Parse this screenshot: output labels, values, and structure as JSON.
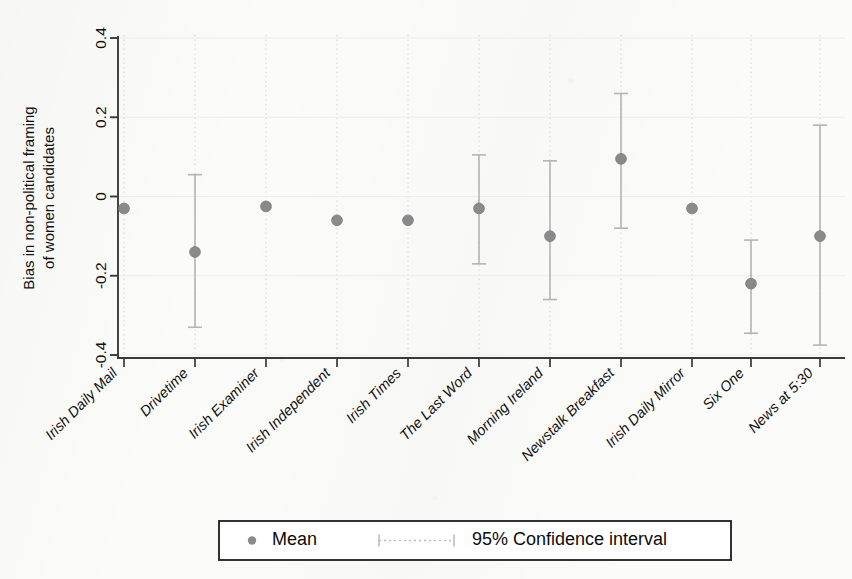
{
  "chart_data": {
    "type": "scatter",
    "title": "",
    "subtitle": "",
    "xlabel": "",
    "ylabel": "Bias in non-political framing of women candidates",
    "ylabel_lines": [
      "Bias in non-political framing",
      "of women candidates"
    ],
    "ylim": [
      -0.4,
      0.4
    ],
    "yticks": [
      0.4,
      0.2,
      0,
      -0.2,
      -0.4
    ],
    "ytick_labels": [
      "0.4",
      "0.2",
      "0",
      "-0.2",
      "-0.4"
    ],
    "grid": "vertical-dotted-per-category",
    "legend_position": "bottom-center",
    "categories": [
      "Irish Daily Mail",
      "Drivetime",
      "Irish Examiner",
      "Irish Independent",
      "Irish Times",
      "The Last Word",
      "Morning Ireland",
      "Newstalk Breakfast",
      "Irish Daily Mirror",
      "Six One",
      "News at 5:30"
    ],
    "series": [
      {
        "name": "Mean",
        "values": [
          -0.03,
          -0.14,
          -0.025,
          -0.06,
          -0.06,
          -0.03,
          -0.1,
          0.095,
          -0.03,
          -0.22,
          -0.1
        ]
      }
    ],
    "ci_low": [
      null,
      -0.33,
      null,
      null,
      null,
      -0.17,
      -0.26,
      -0.08,
      null,
      -0.345,
      -0.375
    ],
    "ci_high": [
      null,
      0.055,
      null,
      null,
      null,
      0.105,
      0.09,
      0.26,
      null,
      -0.11,
      0.18
    ],
    "ci_level": "95%",
    "marker_color": "#8a8a8a",
    "ci_color": "#b4b4b4",
    "axis_color": "#3a3a3a"
  },
  "legend": {
    "mean_label": "Mean",
    "ci_label": "95% Confidence interval"
  }
}
